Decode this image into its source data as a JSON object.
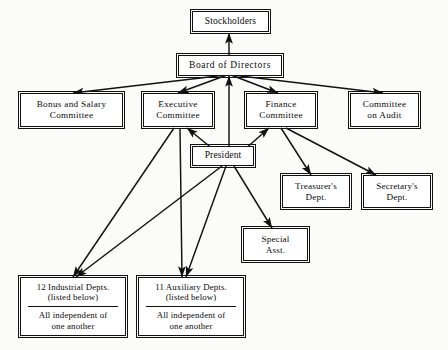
{
  "diagram": {
    "background_color": "#fbfbf9",
    "line_color": "#111111",
    "box_fill": "#ffffff"
  },
  "nodes": {
    "stockholders": {
      "label": "Stockholders"
    },
    "board": {
      "label": "Board of Directors"
    },
    "bonus_salary": {
      "line1": "Bonus and Salary",
      "line2": "Committee"
    },
    "executive": {
      "line1": "Executive",
      "line2": "Committee"
    },
    "finance": {
      "line1": "Finance",
      "line2": "Committee"
    },
    "audit": {
      "line1": "Committee",
      "line2": "on Audit"
    },
    "president": {
      "label": "President"
    },
    "treasurer": {
      "line1": "Treasurer's",
      "line2": "Dept."
    },
    "secretary": {
      "line1": "Secretary's",
      "line2": "Dept."
    },
    "special_asst": {
      "line1": "Special",
      "line2": "Asst."
    },
    "industrial": {
      "line1": "12 Industrial Depts.",
      "line2": "(listed below)",
      "line3": "All independent of",
      "line4": "one another"
    },
    "auxiliary": {
      "line1": "11 Auxiliary Depts.",
      "line2": "(listed below)",
      "line3": "All independent of",
      "line4": "one another"
    }
  },
  "edges": [
    {
      "from": "board",
      "to": "stockholders",
      "arrow": "up"
    },
    {
      "from": "board",
      "to": "bonus_salary",
      "arrow": "down"
    },
    {
      "from": "board",
      "to": "executive",
      "arrow": "down"
    },
    {
      "from": "board",
      "to": "finance",
      "arrow": "down"
    },
    {
      "from": "board",
      "to": "audit",
      "arrow": "down"
    },
    {
      "from": "president",
      "to": "board",
      "arrow": "up"
    },
    {
      "from": "executive",
      "to": "president",
      "arrow": "toward-executive"
    },
    {
      "from": "finance",
      "to": "president",
      "arrow": "toward-finance"
    },
    {
      "from": "president",
      "to": "industrial",
      "arrow": "down"
    },
    {
      "from": "president",
      "to": "auxiliary",
      "arrow": "down"
    },
    {
      "from": "president",
      "to": "special_asst",
      "arrow": "down"
    },
    {
      "from": "executive",
      "to": "industrial",
      "arrow": "down"
    },
    {
      "from": "executive",
      "to": "auxiliary",
      "arrow": "down"
    },
    {
      "from": "finance",
      "to": "treasurer",
      "arrow": "down"
    },
    {
      "from": "finance",
      "to": "secretary",
      "arrow": "down"
    }
  ]
}
